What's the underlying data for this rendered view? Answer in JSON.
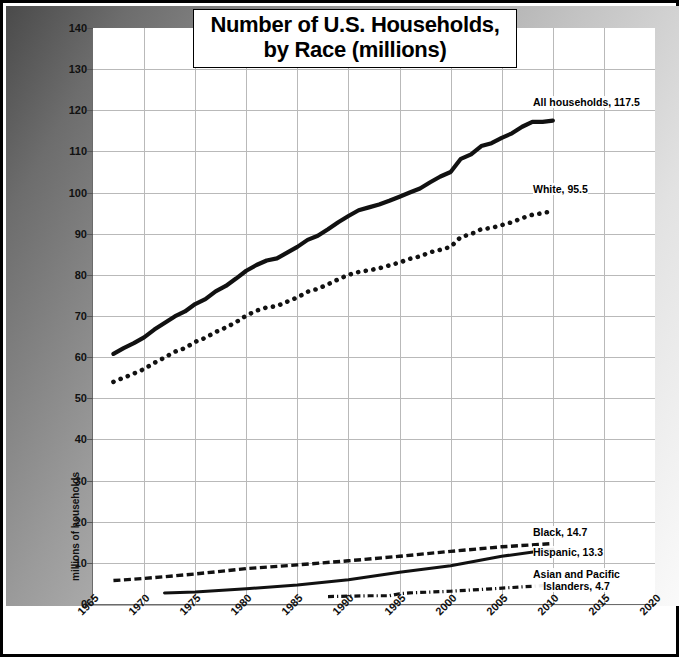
{
  "chart_data": {
    "type": "line",
    "title": "Number of U.S. Households,\nby Race (millions)",
    "title_line1": "Number of U.S. Households,",
    "title_line2": "by Race (millions)",
    "xlabel": "",
    "ylabel": "millions of households",
    "xlim": [
      1965,
      2020
    ],
    "ylim": [
      0,
      140
    ],
    "ytick_step": 10,
    "xtick_step": 5,
    "grid": true,
    "legend_position": "inline-annotations",
    "yticks": [
      "0",
      "10",
      "20",
      "30",
      "40",
      "50",
      "60",
      "70",
      "80",
      "90",
      "100",
      "110",
      "120",
      "130",
      "140"
    ],
    "xticks": [
      "1965",
      "1970",
      "1975",
      "1980",
      "1985",
      "1990",
      "1995",
      "2000",
      "2005",
      "2010",
      "2015",
      "2020"
    ],
    "series": [
      {
        "name": "All households",
        "label": "All households, 117.5",
        "style": "solid-thick",
        "last_value": 117.5,
        "x": [
          1967,
          1968,
          1969,
          1970,
          1971,
          1972,
          1973,
          1974,
          1975,
          1976,
          1977,
          1978,
          1979,
          1980,
          1981,
          1982,
          1983,
          1984,
          1985,
          1986,
          1987,
          1988,
          1989,
          1990,
          1991,
          1992,
          1993,
          1994,
          1995,
          1996,
          1997,
          1998,
          1999,
          2000,
          2001,
          2002,
          2003,
          2004,
          2005,
          2006,
          2007,
          2008,
          2009,
          2010
        ],
        "values": [
          60.8,
          62.2,
          63.4,
          64.8,
          66.7,
          68.3,
          69.9,
          71.1,
          72.9,
          74.1,
          76.0,
          77.3,
          79.1,
          81.0,
          82.4,
          83.5,
          84.0,
          85.4,
          86.8,
          88.5,
          89.5,
          91.1,
          92.8,
          94.3,
          95.7,
          96.4,
          97.1,
          98.0,
          99.0,
          100.0,
          101.0,
          102.5,
          103.9,
          105.0,
          108.2,
          109.3,
          111.3,
          112.0,
          113.3,
          114.4,
          116.0,
          117.2,
          117.2,
          117.5
        ]
      },
      {
        "name": "White",
        "label": "White, 95.5",
        "style": "dotted",
        "last_value": 95.5,
        "x": [
          1967,
          1968,
          1969,
          1970,
          1971,
          1972,
          1973,
          1974,
          1975,
          1976,
          1977,
          1978,
          1979,
          1980,
          1981,
          1982,
          1983,
          1984,
          1985,
          1986,
          1987,
          1988,
          1989,
          1990,
          1991,
          1992,
          1993,
          1994,
          1995,
          1996,
          1997,
          1998,
          1999,
          2000,
          2001,
          2002,
          2003,
          2004,
          2005,
          2006,
          2007,
          2008,
          2009,
          2010
        ],
        "values": [
          54.0,
          55.0,
          56.0,
          57.1,
          58.6,
          59.9,
          61.3,
          62.2,
          63.7,
          64.7,
          66.1,
          67.2,
          68.5,
          70.1,
          71.3,
          72.1,
          72.4,
          73.5,
          74.5,
          75.9,
          76.6,
          77.7,
          78.9,
          80.0,
          80.7,
          81.1,
          81.6,
          82.3,
          83.0,
          83.9,
          84.5,
          85.5,
          86.1,
          86.8,
          89.2,
          89.9,
          91.1,
          91.4,
          92.1,
          92.8,
          93.8,
          94.6,
          95.0,
          95.5
        ]
      },
      {
        "name": "Black",
        "label": "Black, 14.7",
        "style": "dashed",
        "last_value": 14.7,
        "x": [
          1967,
          1970,
          1975,
          1980,
          1985,
          1990,
          1995,
          2000,
          2005,
          2010
        ],
        "values": [
          5.7,
          6.2,
          7.3,
          8.6,
          9.5,
          10.5,
          11.6,
          12.8,
          13.9,
          14.7
        ]
      },
      {
        "name": "Hispanic",
        "label": "Hispanic, 13.3",
        "style": "solid-thin",
        "last_value": 13.3,
        "x": [
          1972,
          1975,
          1980,
          1985,
          1990,
          1995,
          2000,
          2005,
          2010
        ],
        "values": [
          2.7,
          2.9,
          3.7,
          4.6,
          5.9,
          7.7,
          9.3,
          11.6,
          13.3
        ]
      },
      {
        "name": "Asian and Pacific Islanders",
        "label": "Asian and Pacific\nIslanders, 4.7",
        "label_line1": "Asian and Pacific",
        "label_line2": "Islanders, 4.7",
        "style": "dash-dot",
        "last_value": 4.7,
        "x": [
          1988,
          1990,
          1992,
          1994,
          1995,
          1996,
          1998,
          2000,
          2002,
          2004,
          2006,
          2008,
          2010
        ],
        "values": [
          1.8,
          1.9,
          2.0,
          2.0,
          2.5,
          2.7,
          2.9,
          3.1,
          3.4,
          3.7,
          4.0,
          4.3,
          4.7
        ]
      }
    ]
  },
  "colors": {
    "series_line": "#111111",
    "grid": "#b9b9b9",
    "axis": "#6b6b6b",
    "plot_background": "#ffffff",
    "frame": "#000000"
  }
}
